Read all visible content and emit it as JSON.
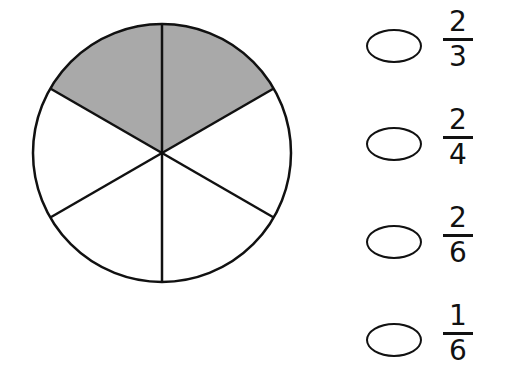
{
  "figure": {
    "shape": "circle",
    "total_parts": 6,
    "shaded_parts": 2,
    "shade_color": "#a9a9a9",
    "line_color": "#111111"
  },
  "options": [
    {
      "numerator": "2",
      "denominator": "3"
    },
    {
      "numerator": "2",
      "denominator": "4"
    },
    {
      "numerator": "2",
      "denominator": "6"
    },
    {
      "numerator": "1",
      "denominator": "6"
    }
  ]
}
